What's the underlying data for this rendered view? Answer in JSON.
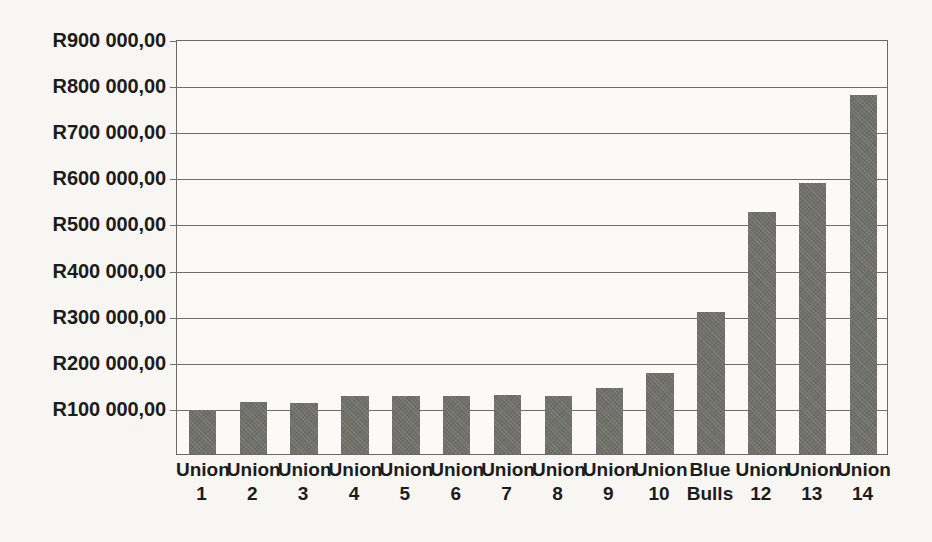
{
  "chart_data": {
    "type": "bar",
    "title": "",
    "subtitle": "",
    "xlabel": "",
    "ylabel": "",
    "currency_symbol": "R",
    "categories": [
      "Union 1",
      "Union 2",
      "Union 3",
      "Union 4",
      "Union 5",
      "Union 6",
      "Union 7",
      "Union 8",
      "Union 9",
      "Union 10",
      "Blue Bulls",
      "Union 12",
      "Union 13",
      "Union 14"
    ],
    "category_lines": [
      [
        "Union",
        "1"
      ],
      [
        "Union",
        "2"
      ],
      [
        "Union",
        "3"
      ],
      [
        "Union",
        "4"
      ],
      [
        "Union",
        "5"
      ],
      [
        "Union",
        "6"
      ],
      [
        "Union",
        "7"
      ],
      [
        "Union",
        "8"
      ],
      [
        "Union",
        "9"
      ],
      [
        "Union",
        "10"
      ],
      [
        "Blue",
        "Bulls"
      ],
      [
        "Union",
        "12"
      ],
      [
        "Union",
        "13"
      ],
      [
        "Union",
        "14"
      ]
    ],
    "values": [
      95000,
      112000,
      110000,
      125000,
      125000,
      125000,
      127000,
      125000,
      143000,
      175000,
      308000,
      525000,
      588000,
      778000
    ],
    "ylim": [
      0,
      900000
    ],
    "ytick_values": [
      100000,
      200000,
      300000,
      400000,
      500000,
      600000,
      700000,
      800000,
      900000
    ],
    "ytick_labels": [
      "R100 000,00",
      "R200 000,00",
      "R300 000,00",
      "R400 000,00",
      "R500 000,00",
      "R600 000,00",
      "R700 000,00",
      "R800 000,00",
      "R900 000,00"
    ],
    "grid": true,
    "grid_axis": "y",
    "legend": false,
    "legend_position": "none",
    "bar_color": "#70706a",
    "grid_color": "#6f6f67",
    "axis_color": "#6a6a62",
    "text_color": "#1c1c1c",
    "background_color": "#f8f6f3",
    "plot_background_color": "#fbfaf7"
  }
}
